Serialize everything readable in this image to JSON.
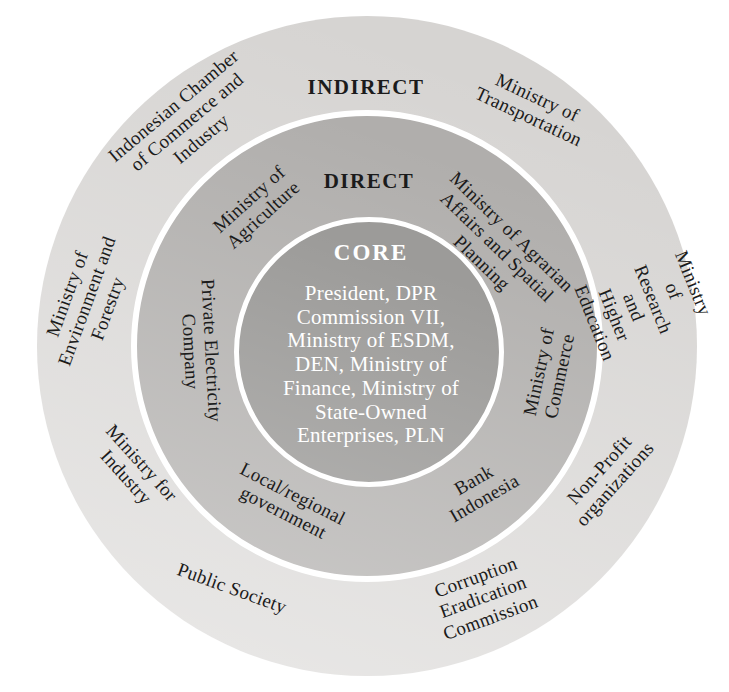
{
  "rings": {
    "core": {
      "title": "CORE",
      "members": "President, DPR\nCommission VII,\nMinistry of ESDM,\nDEN, Ministry of\nFinance, Ministry of\nState-Owned\nEnterprises, PLN"
    },
    "direct": {
      "title": "DIRECT",
      "items": [
        {
          "id": "ministry-of-agriculture",
          "text": "Ministry of\nAgriculture"
        },
        {
          "id": "ministry-of-agrarian-affairs-and-spatial-planning",
          "text": "Ministry of Agrarian\nAffairs and Spatial\nPlanning"
        },
        {
          "id": "ministry-of-commerce",
          "text": "Ministry of\nCommerce"
        },
        {
          "id": "bank-indonesia",
          "text": "Bank\nIndonesia"
        },
        {
          "id": "local-regional-government",
          "text": "Local/regional\ngovernment"
        },
        {
          "id": "private-electricity-company",
          "text": "Private Electricity\nCompany"
        }
      ]
    },
    "indirect": {
      "title": "INDIRECT",
      "items": [
        {
          "id": "indonesian-chamber-of-commerce-and-industry",
          "text": "Indonesian Chamber\nof Commerce and\nIndustry"
        },
        {
          "id": "ministry-of-transportation",
          "text": "Ministry of\nTransportation"
        },
        {
          "id": "ministry-of-research-and-higher-education",
          "text": "Ministry of Research\nand Higher Education"
        },
        {
          "id": "non-profit-organizations",
          "text": "Non-Profit\norganizations"
        },
        {
          "id": "corruption-eradication-commission",
          "text": "Corruption\nEradication\nCommission"
        },
        {
          "id": "public-society",
          "text": "Public Society"
        },
        {
          "id": "ministry-for-industry",
          "text": "Ministry for\nIndustry"
        },
        {
          "id": "ministry-of-environment-and-forestry",
          "text": "Ministry of\nEnvironment and\nForestry"
        }
      ]
    }
  },
  "colors": {
    "outer_ring": "#d6d4d2",
    "middle_ring": "#b0aeac",
    "core_circle": "#9c9b99",
    "ring_separator": "#ffffff",
    "label_text": "#1b1b1b",
    "core_text": "#ffffff",
    "background": "#ffffff"
  }
}
